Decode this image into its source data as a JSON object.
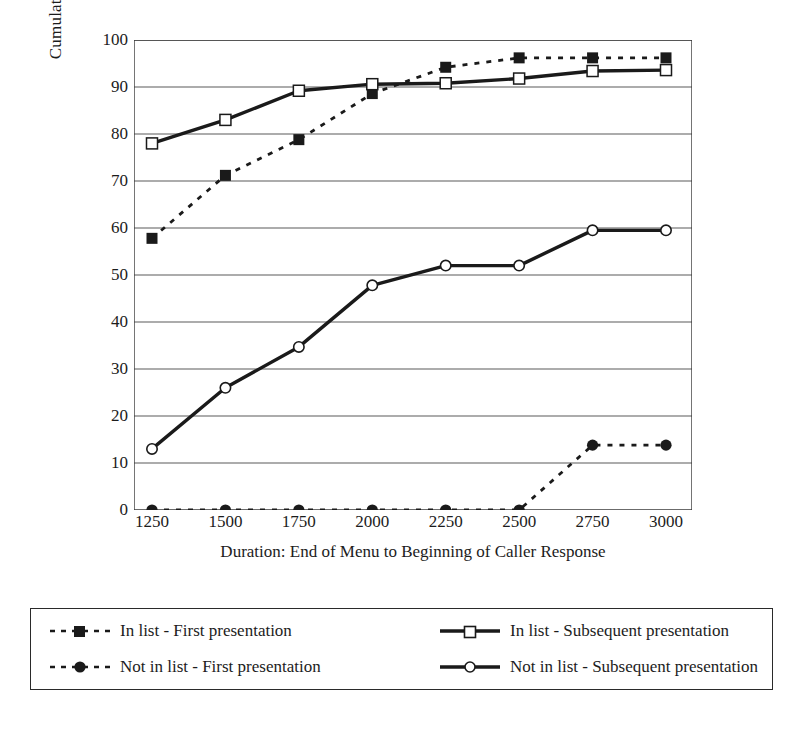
{
  "chart_data": {
    "type": "line",
    "title": "",
    "xlabel": "Duration: End of Menu to Beginning of Caller Response",
    "ylabel": "Cumulative Percentage",
    "x": [
      1250,
      1500,
      1750,
      2000,
      2250,
      2500,
      2750,
      3000
    ],
    "xlim": [
      1250,
      3000
    ],
    "ylim": [
      0,
      100
    ],
    "xticks": [
      "1250",
      "1500",
      "1750",
      "2000",
      "2250",
      "2500",
      "2750",
      "3000"
    ],
    "yticks": [
      "0",
      "10",
      "20",
      "30",
      "40",
      "50",
      "60",
      "70",
      "80",
      "90",
      "100"
    ],
    "grid": "horizontal",
    "legend_position": "below-plot",
    "series": [
      {
        "name": "In list - First presentation",
        "marker": "filled-square",
        "line": "dashed",
        "color": "#1a1a1a",
        "values": [
          57.8,
          71.2,
          78.8,
          88.6,
          94.2,
          96.2,
          96.2,
          96.2
        ]
      },
      {
        "name": "In list - Subsequent presentation",
        "marker": "open-square",
        "line": "solid",
        "color": "#1a1a1a",
        "values": [
          78.0,
          83.0,
          89.2,
          90.6,
          90.8,
          91.8,
          93.4,
          93.6
        ]
      },
      {
        "name": "Not in list - First presentation",
        "marker": "filled-circle",
        "line": "dashed",
        "color": "#1a1a1a",
        "values": [
          0,
          0,
          0,
          0,
          0,
          0,
          13.8,
          13.8
        ]
      },
      {
        "name": "Not in list - Subsequent presentation",
        "marker": "open-circle",
        "line": "solid",
        "color": "#1a1a1a",
        "values": [
          13.0,
          26.0,
          34.7,
          47.8,
          52.0,
          52.0,
          59.5,
          59.5
        ]
      }
    ]
  },
  "legend": {
    "entries": [
      {
        "label": "In list - First presentation",
        "marker": "filled-square",
        "line": "dashed"
      },
      {
        "label": "In list - Subsequent presentation",
        "marker": "open-square",
        "line": "solid"
      },
      {
        "label": "Not in list - First presentation",
        "marker": "filled-circle",
        "line": "dashed"
      },
      {
        "label": "Not in list - Subsequent presentation",
        "marker": "open-circle",
        "line": "solid"
      }
    ]
  },
  "colors": {
    "ink": "#1a1a1a",
    "grid": "#5a5a5a",
    "frame": "#3a3a3a",
    "background": "#ffffff"
  }
}
